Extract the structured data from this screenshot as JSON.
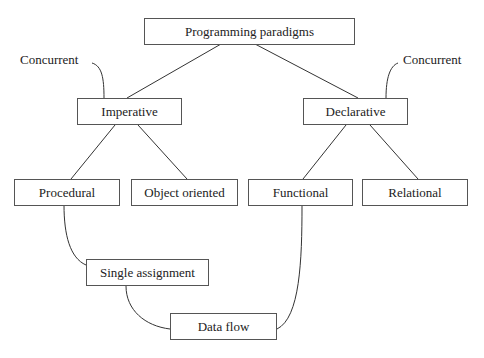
{
  "diagram": {
    "root": "Programming paradigms",
    "nodes": {
      "root": {
        "label": "Programming paradigms"
      },
      "imperative": {
        "label": "Imperative"
      },
      "declarative": {
        "label": "Declarative"
      },
      "procedural": {
        "label": "Procedural"
      },
      "object_oriented": {
        "label": "Object oriented"
      },
      "functional": {
        "label": "Functional"
      },
      "relational": {
        "label": "Relational"
      },
      "single_assignment": {
        "label": "Single assignment"
      },
      "data_flow": {
        "label": "Data flow"
      }
    },
    "annotations": {
      "concurrent_left": "Concurrent",
      "concurrent_right": "Concurrent"
    },
    "edges": [
      {
        "from": "Programming paradigms",
        "to": "Imperative",
        "style": "straight"
      },
      {
        "from": "Programming paradigms",
        "to": "Declarative",
        "style": "straight"
      },
      {
        "from": "Imperative",
        "to": "Procedural",
        "style": "straight"
      },
      {
        "from": "Imperative",
        "to": "Object oriented",
        "style": "straight"
      },
      {
        "from": "Declarative",
        "to": "Functional",
        "style": "straight"
      },
      {
        "from": "Declarative",
        "to": "Relational",
        "style": "straight"
      },
      {
        "from": "Procedural",
        "to": "Single assignment",
        "style": "curved"
      },
      {
        "from": "Single assignment",
        "to": "Data flow",
        "style": "curved"
      },
      {
        "from": "Functional",
        "to": "Data flow",
        "style": "curved"
      },
      {
        "from": "Concurrent",
        "to": "Imperative",
        "style": "curved-annotation"
      },
      {
        "from": "Concurrent",
        "to": "Declarative",
        "style": "curved-annotation"
      }
    ]
  }
}
